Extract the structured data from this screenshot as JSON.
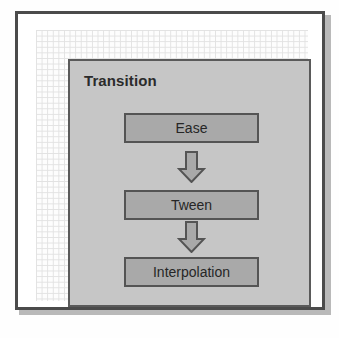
{
  "diagram": {
    "title": "Transition",
    "nodes": [
      {
        "label": "Ease"
      },
      {
        "label": "Tween"
      },
      {
        "label": "Interpolation"
      }
    ],
    "connectors": [
      {
        "icon": "down-block-arrow-icon",
        "from": "Ease",
        "to": "Tween"
      },
      {
        "icon": "down-block-arrow-icon",
        "from": "Tween",
        "to": "Interpolation"
      }
    ],
    "colors": {
      "panel_fill": "#c6c6c6",
      "panel_border": "#5a5a5a",
      "node_fill": "#a9a9a9",
      "node_border": "#545454",
      "frame_border": "#4b4b4b",
      "text": "#262626",
      "title_text": "#2b2b2b",
      "grid_line": "#e2e2e2",
      "page_background": "#ffffff"
    }
  }
}
